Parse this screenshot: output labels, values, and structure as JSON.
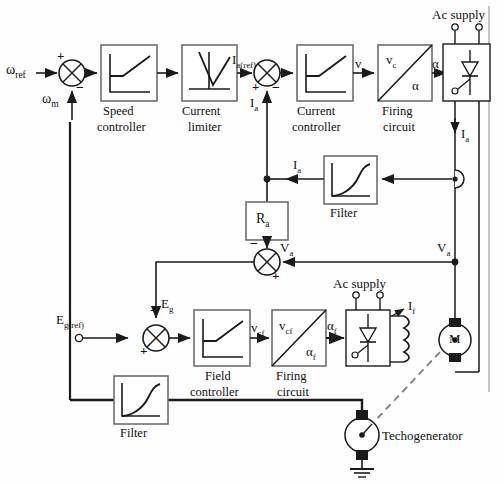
{
  "figure": {
    "type": "control-block-diagram"
  },
  "blocks": {
    "speed_controller": "Speed\ncontroller",
    "speed_controller_l1": "Speed",
    "speed_controller_l2": "controller",
    "current_limiter_l1": "Current",
    "current_limiter_l2": "limiter",
    "current_controller_l1": "Current",
    "current_controller_l2": "controller",
    "firing_circuit_l1": "Firing",
    "firing_circuit_l2": "circuit",
    "filter_armature": "Filter",
    "ra_block": "R",
    "ra_sub": "a",
    "field_controller_l1": "Field",
    "field_controller_l2": "controller",
    "field_firing_l1": "Firing",
    "field_firing_l2": "circuit",
    "filter_speed": "Filter",
    "motor": "M",
    "techogenerator": "Techogenerator"
  },
  "signals": {
    "w_ref": "ω",
    "w_ref_sub": "ref",
    "w_m": "ω",
    "w_m_sub": "m",
    "ia_ref": "I",
    "ia_ref_sub": "a(ref)",
    "ia": "I",
    "ia_sub": "a",
    "ia_fb": "I",
    "ia_fb_sub": "a",
    "ia_conv": "I",
    "ia_conv_sub": "a",
    "vc": "v",
    "vc_sub": "c",
    "vc_in": "v",
    "vc_in_sub": "c",
    "alpha": "α",
    "alpha_out": "α",
    "va_left": "V",
    "va_left_sub": "a",
    "va_right": "V",
    "va_right_sub": "a",
    "eg_ref": "E",
    "eg_ref_sub": "g(ref)",
    "eg": "E",
    "eg_sub": "g",
    "vcf": "v",
    "vcf_sub": "cf",
    "vcf_in": "v",
    "vcf_in_sub": "cf",
    "alpha_f": "α",
    "alpha_f_sub": "f",
    "alpha_f_out": "α",
    "alpha_f_out_sub": "f",
    "if": "I",
    "if_sub": "f",
    "ac_supply_top": "Ac supply",
    "ac_supply_field": "Ac supply"
  },
  "signs": {
    "speed_sum_plus": "+",
    "speed_sum_minus": "−",
    "current_sum_plus": "+",
    "current_sum_minus": "−",
    "va_sum_minus": "−",
    "va_sum_plus": "+",
    "field_sum_plus": "+",
    "field_sum_minus": "−"
  },
  "colors": {
    "line": "#1a1a1a",
    "block_border": "#6e6e6e",
    "block_fill": "#ffffff",
    "background": "#fefefe",
    "text": "#111111",
    "dashed": "#8a8a8a"
  }
}
